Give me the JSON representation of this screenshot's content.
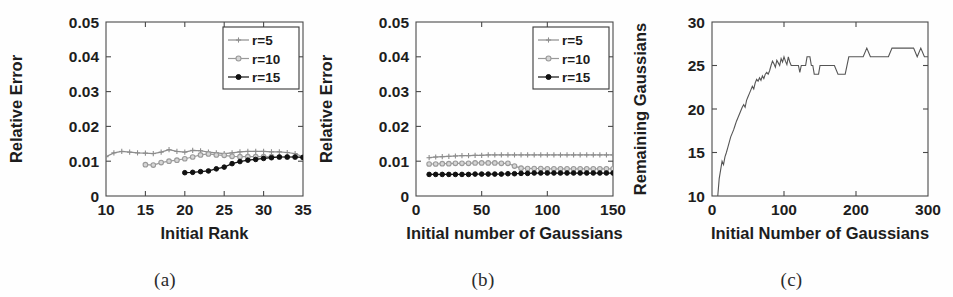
{
  "figure": {
    "panels": [
      {
        "id": "a",
        "caption": "(a)",
        "chart_data": {
          "type": "line",
          "title": "",
          "xlabel": "Initial Rank",
          "ylabel": "Relative Error",
          "xlim": [
            10,
            35
          ],
          "ylim": [
            0,
            0.05
          ],
          "xticks": [
            10,
            15,
            20,
            25,
            30,
            35
          ],
          "xtick_labels": [
            "10",
            "15",
            "20",
            "25",
            "30",
            "35"
          ],
          "yticks": [
            0,
            0.01,
            0.02,
            0.03,
            0.04,
            0.05
          ],
          "ytick_labels": [
            "0",
            "0.01",
            "0.02",
            "0.03",
            "0.04",
            "0.05"
          ],
          "grid": false,
          "legend_position": "top-right",
          "series": [
            {
              "name": "r=5",
              "color": "#8d8d8d",
              "marker": "plus",
              "x": [
                10,
                11,
                12,
                13,
                14,
                15,
                16,
                17,
                18,
                19,
                20,
                21,
                22,
                23,
                24,
                25,
                26,
                27,
                28,
                29,
                30,
                31,
                32,
                33,
                34,
                35
              ],
              "values": [
                0.0113,
                0.0124,
                0.0128,
                0.0126,
                0.0124,
                0.0123,
                0.0122,
                0.0126,
                0.0133,
                0.0128,
                0.0126,
                0.0131,
                0.013,
                0.0126,
                0.0124,
                0.0122,
                0.0124,
                0.0127,
                0.0128,
                0.0128,
                0.0128,
                0.0127,
                0.0127,
                0.0125,
                0.0122,
                0.0112
              ]
            },
            {
              "name": "r=10",
              "color": "#9a9a9a",
              "marker": "circle-open",
              "x": [
                15,
                16,
                17,
                18,
                19,
                20,
                21,
                22,
                23,
                24,
                25,
                26,
                27,
                28,
                29,
                30,
                31,
                32,
                33,
                34,
                35
              ],
              "values": [
                0.009,
                0.0089,
                0.0096,
                0.01,
                0.0103,
                0.0107,
                0.0112,
                0.0118,
                0.0121,
                0.0118,
                0.0117,
                0.0114,
                0.0113,
                0.0113,
                0.0113,
                0.0113,
                0.0113,
                0.0112,
                0.0112,
                0.0112,
                0.0111
              ]
            },
            {
              "name": "r=15",
              "color": "#111111",
              "marker": "circle-filled",
              "x": [
                20,
                21,
                22,
                23,
                24,
                25,
                26,
                27,
                28,
                29,
                30,
                31,
                32,
                33,
                34,
                35
              ],
              "values": [
                0.0067,
                0.0068,
                0.007,
                0.0072,
                0.0078,
                0.0083,
                0.0093,
                0.0099,
                0.0103,
                0.0105,
                0.0108,
                0.011,
                0.0112,
                0.0112,
                0.0112,
                0.0111
              ]
            }
          ]
        }
      },
      {
        "id": "b",
        "caption": "(b)",
        "chart_data": {
          "type": "line",
          "title": "",
          "xlabel": "Initial number of Gaussians",
          "ylabel": "Relative Error",
          "xlim": [
            0,
            150
          ],
          "ylim": [
            0,
            0.05
          ],
          "xticks": [
            0,
            50,
            100,
            150
          ],
          "xtick_labels": [
            "0",
            "50",
            "100",
            "150"
          ],
          "yticks": [
            0,
            0.01,
            0.02,
            0.03,
            0.04,
            0.05
          ],
          "ytick_labels": [
            "0",
            "0.01",
            "0.02",
            "0.03",
            "0.04",
            "0.05"
          ],
          "grid": false,
          "legend_position": "top-right",
          "series": [
            {
              "name": "r=5",
              "color": "#8d8d8d",
              "marker": "plus",
              "x": [
                10,
                15,
                20,
                25,
                30,
                35,
                40,
                45,
                50,
                55,
                60,
                65,
                70,
                75,
                80,
                85,
                90,
                95,
                100,
                105,
                110,
                115,
                120,
                125,
                130,
                135,
                140,
                145,
                150
              ],
              "values": [
                0.011,
                0.0112,
                0.0113,
                0.0114,
                0.0115,
                0.0116,
                0.0116,
                0.0117,
                0.0117,
                0.0118,
                0.0118,
                0.0118,
                0.0118,
                0.0118,
                0.0118,
                0.0118,
                0.0118,
                0.0118,
                0.0118,
                0.0118,
                0.0118,
                0.0118,
                0.0118,
                0.0118,
                0.0118,
                0.0118,
                0.0118,
                0.0118,
                0.0118
              ]
            },
            {
              "name": "r=10",
              "color": "#9a9a9a",
              "marker": "circle-open",
              "x": [
                10,
                15,
                20,
                25,
                30,
                35,
                40,
                45,
                50,
                55,
                60,
                65,
                70,
                75,
                80,
                85,
                90,
                95,
                100,
                105,
                110,
                115,
                120,
                125,
                130,
                135,
                140,
                145,
                150
              ],
              "values": [
                0.0092,
                0.0092,
                0.0093,
                0.0093,
                0.0094,
                0.0094,
                0.0094,
                0.0095,
                0.0095,
                0.0095,
                0.0095,
                0.0094,
                0.0094,
                0.0086,
                0.008,
                0.0079,
                0.0079,
                0.0079,
                0.0078,
                0.0078,
                0.0078,
                0.0078,
                0.0078,
                0.0078,
                0.0078,
                0.0078,
                0.0078,
                0.0078,
                0.0078
              ]
            },
            {
              "name": "r=15",
              "color": "#111111",
              "marker": "circle-filled",
              "x": [
                10,
                15,
                20,
                25,
                30,
                35,
                40,
                45,
                50,
                55,
                60,
                65,
                70,
                75,
                80,
                85,
                90,
                95,
                100,
                105,
                110,
                115,
                120,
                125,
                130,
                135,
                140,
                145,
                150
              ],
              "values": [
                0.0062,
                0.0062,
                0.0062,
                0.0062,
                0.0062,
                0.0062,
                0.0062,
                0.0063,
                0.0063,
                0.0063,
                0.0063,
                0.0063,
                0.0064,
                0.0064,
                0.0065,
                0.0065,
                0.0066,
                0.0066,
                0.0066,
                0.0066,
                0.0066,
                0.0066,
                0.0066,
                0.0066,
                0.0066,
                0.0066,
                0.0066,
                0.0066,
                0.0066
              ]
            }
          ]
        }
      },
      {
        "id": "c",
        "caption": "(c)",
        "chart_data": {
          "type": "line",
          "title": "",
          "xlabel": "Initial Number of Gaussians",
          "ylabel": "Remaining Gaussians",
          "xlim": [
            0,
            300
          ],
          "ylim": [
            10,
            30
          ],
          "xticks": [
            0,
            100,
            200,
            300
          ],
          "xtick_labels": [
            "0",
            "100",
            "200",
            "300"
          ],
          "yticks": [
            10,
            15,
            20,
            25,
            30
          ],
          "ytick_labels": [
            "10",
            "15",
            "20",
            "25",
            "30"
          ],
          "grid": false,
          "legend_position": "none",
          "series": [
            {
              "name": "remaining-gaussians",
              "color": "#555555",
              "marker": "none",
              "x": [
                8,
                10,
                12,
                14,
                16,
                18,
                20,
                22,
                24,
                26,
                28,
                30,
                32,
                34,
                36,
                38,
                40,
                42,
                44,
                46,
                48,
                50,
                52,
                54,
                56,
                58,
                60,
                62,
                64,
                66,
                68,
                70,
                72,
                74,
                76,
                78,
                80,
                82,
                84,
                86,
                88,
                90,
                92,
                94,
                96,
                98,
                100,
                102,
                104,
                106,
                108,
                110,
                112,
                114,
                116,
                118,
                120,
                122,
                124,
                126,
                128,
                130,
                132,
                134,
                136,
                138,
                140,
                142,
                144,
                146,
                148,
                150,
                155,
                160,
                165,
                170,
                175,
                180,
                185,
                190,
                195,
                200,
                205,
                210,
                215,
                220,
                225,
                230,
                235,
                240,
                245,
                250,
                255,
                260,
                265,
                270,
                275,
                280,
                285,
                290,
                295,
                300
              ],
              "values": [
                10,
                12,
                13,
                14,
                13.6,
                14.5,
                15,
                15.6,
                16.2,
                16.8,
                17.2,
                17.6,
                18.1,
                18.6,
                19,
                19.4,
                19.8,
                20.2,
                20.5,
                20.2,
                21,
                21.4,
                21.8,
                22.2,
                22.6,
                22.3,
                23,
                23.4,
                23.2,
                23.6,
                23.3,
                23.8,
                23.5,
                24,
                24.2,
                24,
                24.4,
                25,
                25.5,
                25.2,
                24.8,
                25.6,
                25.3,
                25,
                25.8,
                25.4,
                26,
                25.5,
                25.1,
                26,
                25.4,
                25,
                25,
                25,
                25,
                25,
                25,
                24.2,
                25,
                25,
                25,
                25,
                26,
                26,
                26,
                25,
                25,
                24,
                24,
                24,
                24,
                25,
                25,
                25,
                25,
                25,
                24,
                24,
                24,
                26,
                26,
                26,
                26,
                26,
                27,
                26,
                26,
                26,
                26,
                26,
                26,
                27,
                27,
                27,
                27,
                27,
                27,
                27,
                26,
                27,
                26,
                26,
                26
              ]
            }
          ]
        }
      }
    ]
  }
}
